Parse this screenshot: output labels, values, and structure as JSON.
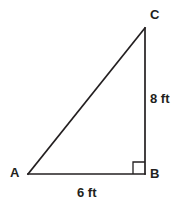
{
  "figure": {
    "type": "right-triangle-diagram",
    "background_color": "#ffffff",
    "stroke_color": "#231f20",
    "stroke_width": 1.6,
    "vertices": {
      "A": {
        "label": "A",
        "x": 28,
        "y": 174
      },
      "B": {
        "label": "B",
        "x": 145,
        "y": 174
      },
      "C": {
        "label": "C",
        "x": 145,
        "y": 28
      }
    },
    "labels": {
      "vertex_a": "A",
      "vertex_b": "B",
      "vertex_c": "C"
    },
    "sides": [
      {
        "name": "AB",
        "measure": "6 ft",
        "value": 6,
        "unit": "ft",
        "orientation": "horizontal"
      },
      {
        "name": "BC",
        "measure": "8 ft",
        "value": 8,
        "unit": "ft",
        "orientation": "vertical"
      },
      {
        "name": "AC",
        "measure": "",
        "value": null,
        "unit": "",
        "orientation": "hypotenuse"
      }
    ],
    "measures": {
      "leg_ab": "6 ft",
      "leg_bc": "8 ft"
    },
    "right_angle": {
      "at_vertex": "B",
      "marker": "square",
      "size": 12
    }
  }
}
